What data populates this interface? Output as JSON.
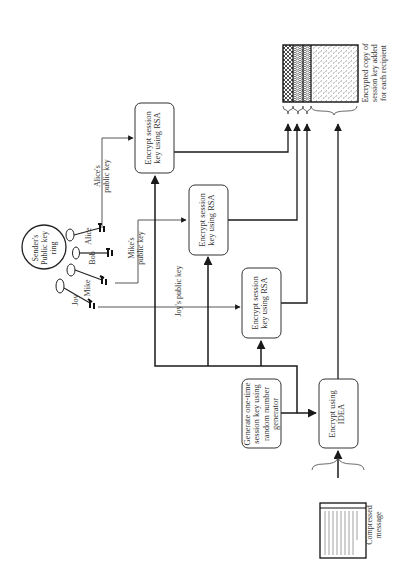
{
  "diagram": {
    "type": "flowchart",
    "orientation": "rotated-90",
    "key_ring": {
      "label": "Sender's\nPublic key\nring",
      "recipients": [
        {
          "name": "Alice"
        },
        {
          "name": "Bob"
        },
        {
          "name": "Mike"
        },
        {
          "name": "Joy"
        }
      ]
    },
    "nodes": {
      "rsa_alice": {
        "label": "Encrypt session\nkey using RSA"
      },
      "rsa_mike": {
        "label": "Encrypt session\nkey using RSA"
      },
      "rsa_joy": {
        "label": "Encrypt session\nkey using RSA"
      },
      "generate": {
        "label": "Generate one-time\nsession key using\nrandom number\ngenerator"
      },
      "idea": {
        "label": "Encrypt using\nIDEA"
      }
    },
    "edge_labels": {
      "alice_key": "Alice's\npublic key",
      "mike_key": "Mike's\npublic key",
      "joy_key": "Joy's public key"
    },
    "output": {
      "caption": "Encrypted copy of\nsession key added\nfor each recipient",
      "segments": 4
    },
    "input": {
      "caption": "Compressed\nmessage",
      "document_title": "Bob's signature",
      "document_body": "This to: Alice, Bob, Mike, and Joy. Bob will sign and encrypt the message before sending it to all three in one message."
    },
    "colors": {
      "line": "#1a1a1a",
      "box_border": "#333333",
      "background": "#ffffff"
    }
  }
}
